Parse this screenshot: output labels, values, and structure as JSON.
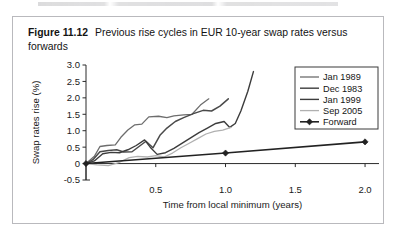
{
  "caption": {
    "number": "Figure 11.12",
    "text": "Previous rise cycles in EUR 10-year swap rates versus forwards"
  },
  "chart_data": {
    "type": "line",
    "title": "Previous rise cycles in EUR 10-year swap rates versus forwards",
    "xlabel": "Time from local minimum (years)",
    "ylabel": "Swap rates rise (%)",
    "xlim": [
      0,
      2.1
    ],
    "ylim": [
      -0.5,
      3.0
    ],
    "xticks": [
      "0.5",
      "1.0",
      "1.5",
      "2.0"
    ],
    "xtick_values": [
      0.5,
      1.0,
      1.5,
      2.0
    ],
    "yticks": [
      "3.0",
      "2.5",
      "2.0",
      "1.5",
      "1.0",
      "0.5",
      "0",
      "-0.5"
    ],
    "ytick_values": [
      3.0,
      2.5,
      2.0,
      1.5,
      1.0,
      0.5,
      0,
      -0.5
    ],
    "grid": false,
    "legend_position": "upper right",
    "series": [
      {
        "name": "Jan 1989",
        "color": "#6d6d6d",
        "width": 1.3,
        "marker": "none",
        "points": [
          [
            0.0,
            0.0
          ],
          [
            0.06,
            0.22
          ],
          [
            0.1,
            0.52
          ],
          [
            0.15,
            0.55
          ],
          [
            0.21,
            0.57
          ],
          [
            0.25,
            0.8
          ],
          [
            0.3,
            1.02
          ],
          [
            0.35,
            1.18
          ],
          [
            0.4,
            1.2
          ],
          [
            0.45,
            1.42
          ],
          [
            0.52,
            1.44
          ],
          [
            0.58,
            1.4
          ],
          [
            0.63,
            1.45
          ],
          [
            0.7,
            1.48
          ],
          [
            0.76,
            1.5
          ],
          [
            0.82,
            1.78
          ],
          [
            0.88,
            1.97
          ]
        ]
      },
      {
        "name": "Dec 1983",
        "color": "#4a4a4a",
        "width": 1.5,
        "marker": "none",
        "points": [
          [
            0.0,
            0.0
          ],
          [
            0.05,
            0.12
          ],
          [
            0.1,
            0.36
          ],
          [
            0.16,
            0.4
          ],
          [
            0.22,
            0.42
          ],
          [
            0.27,
            0.35
          ],
          [
            0.33,
            0.36
          ],
          [
            0.38,
            0.52
          ],
          [
            0.43,
            0.68
          ],
          [
            0.48,
            0.48
          ],
          [
            0.53,
            0.86
          ],
          [
            0.58,
            1.08
          ],
          [
            0.64,
            1.28
          ],
          [
            0.7,
            1.4
          ],
          [
            0.77,
            1.52
          ],
          [
            0.84,
            1.62
          ],
          [
            0.9,
            1.6
          ],
          [
            0.96,
            1.75
          ],
          [
            1.02,
            1.97
          ]
        ]
      },
      {
        "name": "Jan 1999",
        "color": "#3c3c3c",
        "width": 1.4,
        "marker": "none",
        "points": [
          [
            0.0,
            0.0
          ],
          [
            0.06,
            0.08
          ],
          [
            0.12,
            0.3
          ],
          [
            0.18,
            0.34
          ],
          [
            0.24,
            0.33
          ],
          [
            0.3,
            0.42
          ],
          [
            0.36,
            0.55
          ],
          [
            0.42,
            0.72
          ],
          [
            0.46,
            0.5
          ],
          [
            0.51,
            0.28
          ],
          [
            0.57,
            0.33
          ],
          [
            0.63,
            0.46
          ],
          [
            0.69,
            0.62
          ],
          [
            0.75,
            0.78
          ],
          [
            0.81,
            0.94
          ],
          [
            0.87,
            1.08
          ],
          [
            0.93,
            1.22
          ],
          [
            0.99,
            1.28
          ],
          [
            1.03,
            1.1
          ],
          [
            1.07,
            1.22
          ],
          [
            1.11,
            1.6
          ],
          [
            1.16,
            2.2
          ],
          [
            1.2,
            2.8
          ]
        ]
      },
      {
        "name": "Sep 2005",
        "color": "#b0b0b0",
        "width": 1.3,
        "marker": "none",
        "points": [
          [
            0.0,
            0.0
          ],
          [
            0.08,
            -0.04
          ],
          [
            0.16,
            -0.06
          ],
          [
            0.24,
            0.04
          ],
          [
            0.31,
            0.18
          ],
          [
            0.37,
            0.22
          ],
          [
            0.44,
            0.2
          ],
          [
            0.5,
            0.24
          ],
          [
            0.56,
            0.2
          ],
          [
            0.62,
            0.32
          ],
          [
            0.68,
            0.48
          ],
          [
            0.74,
            0.62
          ],
          [
            0.8,
            0.76
          ],
          [
            0.86,
            0.9
          ],
          [
            0.92,
            0.98
          ],
          [
            0.98,
            1.02
          ],
          [
            1.04,
            1.1
          ]
        ]
      },
      {
        "name": "Forward",
        "color": "#222222",
        "width": 1.6,
        "marker": "diamond",
        "points": [
          [
            0.0,
            0.0
          ],
          [
            1.0,
            0.32
          ],
          [
            2.0,
            0.66
          ]
        ]
      }
    ]
  }
}
